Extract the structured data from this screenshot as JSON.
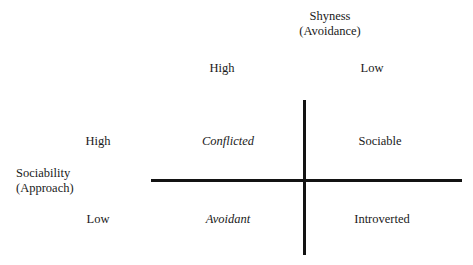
{
  "figure": {
    "background_color": "#ffffff",
    "line_color": "#131313",
    "text_color": "#1a1a1a"
  },
  "axes": {
    "horizontal": {
      "title_line1": "Shyness",
      "title_line2": "(Avoidance)",
      "levels": [
        {
          "id": "high",
          "label": "High"
        },
        {
          "id": "low",
          "label": "Low"
        }
      ]
    },
    "vertical": {
      "title_line1": "Sociability",
      "title_line2": "(Approach)",
      "levels": [
        {
          "id": "high",
          "label": "High"
        },
        {
          "id": "low",
          "label": "Low"
        }
      ]
    }
  },
  "chart_data": {
    "type": "table",
    "xlabel": "Shyness (Avoidance)",
    "ylabel": "Sociability (Approach)",
    "columns": [
      "High",
      "Low"
    ],
    "rows": [
      "High",
      "Low"
    ],
    "cells": [
      [
        {
          "label": "Conflicted",
          "style": "italic",
          "shyness": "High",
          "sociability": "High"
        },
        {
          "label": "Sociable",
          "style": "normal",
          "shyness": "Low",
          "sociability": "High"
        }
      ],
      [
        {
          "label": "Avoidant",
          "style": "italic",
          "shyness": "High",
          "sociability": "Low"
        },
        {
          "label": "Introverted",
          "style": "normal",
          "shyness": "Low",
          "sociability": "Low"
        }
      ]
    ],
    "grid": false,
    "legend": "none"
  }
}
